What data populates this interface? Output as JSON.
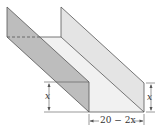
{
  "figure": {
    "labels": {
      "left_height": "x",
      "right_height": "x",
      "base_width": "20 − 2x"
    },
    "colors": {
      "left_wall": "#b8b8b8",
      "right_wall": "#e6e6e6",
      "floor": "#f1f1f1",
      "line": "#555555"
    }
  }
}
